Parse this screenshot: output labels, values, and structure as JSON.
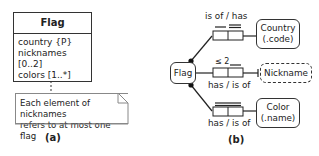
{
  "panel_a": {
    "class": {
      "name": "Flag",
      "attributes": [
        "country {P}",
        "nicknames [0..2]",
        "colors [1..*]"
      ]
    },
    "note": {
      "line1": "Each element of nicknames",
      "line2": "refers to at most one flag"
    },
    "caption": "(a)"
  },
  "panel_b": {
    "entity": "Flag",
    "types": [
      {
        "line1": "Country",
        "line2": "(.code)",
        "style": "solid"
      },
      {
        "line1": "Nickname",
        "style": "dashed"
      },
      {
        "line1": "Color",
        "line2": "(.name)",
        "style": "solid"
      }
    ],
    "facts": [
      {
        "reading": "is of / has",
        "constraint": ""
      },
      {
        "reading": "has / is of",
        "constraint": "≤ 2"
      },
      {
        "reading": "has / is of",
        "constraint": ""
      }
    ],
    "caption": "(b)"
  }
}
